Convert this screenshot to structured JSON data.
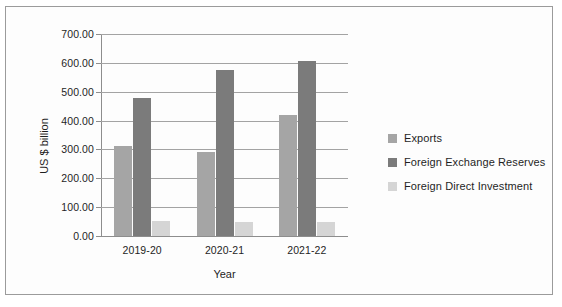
{
  "chart_data": {
    "type": "bar",
    "title": "",
    "xlabel": "Year",
    "ylabel": "US $ billion",
    "categories": [
      "2019-20",
      "2020-21",
      "2021-22"
    ],
    "series": [
      {
        "name": "Exports",
        "values": [
          313.36,
          291.81,
          417.81
        ],
        "color": "#a5a5a5"
      },
      {
        "name": "Foreign Exchange Reserves",
        "values": [
          477.81,
          576.98,
          607.31
        ],
        "color": "#7b7b7b"
      },
      {
        "name": "Foreign Direct Investment",
        "values": [
          52.0,
          49.98,
          48.6
        ],
        "color": "#d5d5d5"
      }
    ],
    "ylim": [
      0,
      700
    ],
    "ytick_values": [
      0,
      100,
      200,
      300,
      400,
      500,
      600,
      700
    ],
    "ytick_labels": [
      "0.00",
      "100.00",
      "200.00",
      "300.00",
      "400.00",
      "500.00",
      "600.00",
      "700.00"
    ],
    "grid": true,
    "legend_position": "right"
  },
  "legend": {
    "entries": [
      {
        "label": "Exports",
        "color": "#a5a5a5"
      },
      {
        "label": "Foreign Exchange Reserves",
        "color": "#7b7b7b"
      },
      {
        "label": "Foreign Direct Investment",
        "color": "#d5d5d5"
      }
    ]
  }
}
